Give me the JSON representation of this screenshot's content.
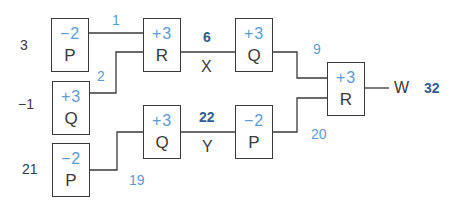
{
  "inputs": [
    {
      "value": "3"
    },
    {
      "value": "−1"
    },
    {
      "value": "21"
    }
  ],
  "boxes": [
    {
      "id": "p1",
      "op": "−2",
      "name": "P"
    },
    {
      "id": "q1",
      "op": "+3",
      "name": "Q"
    },
    {
      "id": "p2",
      "op": "−2",
      "name": "P"
    },
    {
      "id": "r1",
      "op": "+3",
      "name": "R"
    },
    {
      "id": "q2",
      "op": "+3",
      "name": "Q"
    },
    {
      "id": "q3",
      "op": "+3",
      "name": "Q"
    },
    {
      "id": "p3",
      "op": "−2",
      "name": "P"
    },
    {
      "id": "r2",
      "op": "+3",
      "name": "R"
    }
  ],
  "intermediate_values": {
    "p1_out": "1",
    "q1_out": "2",
    "p2_out": "19",
    "q3_out": "9",
    "p3_out": "20"
  },
  "variables": {
    "x": {
      "name": "X",
      "value": "6"
    },
    "y": {
      "name": "Y",
      "value": "22"
    },
    "w": {
      "name": "W",
      "value": "32"
    }
  },
  "colors": {
    "line": "#3a3a3a",
    "op_text": "#5b9bd5",
    "result_text": "#2f5f8f"
  }
}
